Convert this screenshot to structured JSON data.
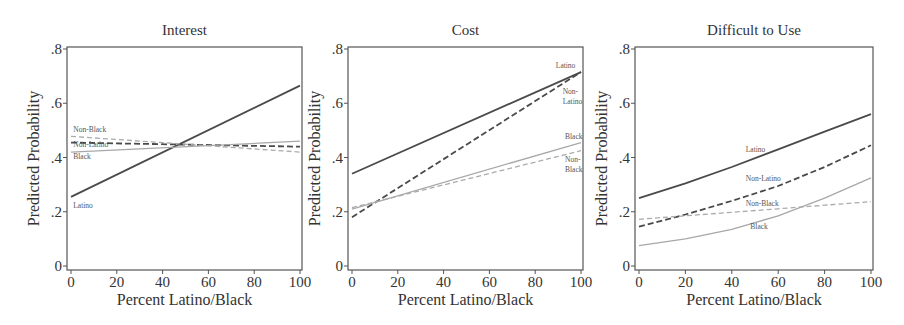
{
  "figure": {
    "shared": {
      "ylabel": "Predicted Probability",
      "xlabel": "Percent Latino/Black",
      "xticks": [
        "0",
        "20",
        "40",
        "60",
        "80",
        "100"
      ],
      "yticks": [
        "0",
        ".2",
        ".4",
        ".6",
        ".8"
      ]
    }
  },
  "chart_data": [
    {
      "type": "line",
      "title": "Interest",
      "xlabel": "Percent Latino/Black",
      "ylabel": "Predicted Probability",
      "xlim": [
        0,
        100
      ],
      "ylim": [
        0,
        0.8
      ],
      "x": [
        0,
        100
      ],
      "series": [
        {
          "name": "Latino",
          "style": "solid-dark",
          "color": "#444444",
          "values": [
            0.255,
            0.665
          ],
          "label_pos": {
            "x": 1,
            "y": 0.215
          }
        },
        {
          "name": "Non-Latino",
          "style": "dashed-dark",
          "color": "#444444",
          "values": [
            0.455,
            0.44
          ],
          "label_pos": {
            "x": 1,
            "y": 0.437
          }
        },
        {
          "name": "Black",
          "style": "solid-light",
          "color": "#a8a8a8",
          "values": [
            0.42,
            0.46
          ],
          "label_pos": {
            "x": 1,
            "y": 0.395
          }
        },
        {
          "name": "Non-Black",
          "style": "dashed-light",
          "color": "#a8a8a8",
          "values": [
            0.478,
            0.42
          ],
          "label_pos": {
            "x": 1,
            "y": 0.495
          }
        }
      ]
    },
    {
      "type": "line",
      "title": "Cost",
      "xlabel": "Percent Latino/Black",
      "ylabel": "Predicted Probability",
      "xlim": [
        0,
        100
      ],
      "ylim": [
        0,
        0.8
      ],
      "x": [
        0,
        100
      ],
      "series": [
        {
          "name": "Latino",
          "style": "solid-dark",
          "color": "#444444",
          "values": [
            0.34,
            0.715
          ],
          "label_pos": {
            "x": 89,
            "y": 0.73
          }
        },
        {
          "name": "Non-Latino",
          "style": "dashed-dark",
          "color": "#444444",
          "values": [
            0.18,
            0.715
          ],
          "label_pos": {
            "x": 92,
            "y": 0.635
          }
        },
        {
          "name": "Black",
          "style": "solid-light",
          "color": "#a8a8a8",
          "values": [
            0.21,
            0.455
          ],
          "label_pos": {
            "x": 93,
            "y": 0.47
          }
        },
        {
          "name": "Non-Black",
          "style": "dashed-light",
          "color": "#a8a8a8",
          "values": [
            0.215,
            0.425
          ],
          "label_pos": {
            "x": 93,
            "y": 0.385
          }
        }
      ]
    },
    {
      "type": "line",
      "title": "Difficult to Use",
      "xlabel": "Percent Latino/Black",
      "ylabel": "Predicted Probability",
      "xlim": [
        0,
        100
      ],
      "ylim": [
        0,
        0.8
      ],
      "x": [
        0,
        20,
        40,
        60,
        80,
        100
      ],
      "series": [
        {
          "name": "Latino",
          "style": "solid-dark",
          "color": "#444444",
          "values": [
            0.25,
            0.305,
            0.365,
            0.43,
            0.495,
            0.56
          ],
          "label_pos": {
            "x": 46,
            "y": 0.42
          }
        },
        {
          "name": "Non-Latino",
          "style": "dashed-dark",
          "color": "#444444",
          "values": [
            0.145,
            0.19,
            0.24,
            0.295,
            0.365,
            0.445
          ],
          "label_pos": {
            "x": 46,
            "y": 0.315
          }
        },
        {
          "name": "Non-Black",
          "style": "dashed-light",
          "color": "#a8a8a8",
          "values": [
            0.172,
            0.185,
            0.198,
            0.211,
            0.224,
            0.237
          ],
          "label_pos": {
            "x": 46,
            "y": 0.22
          }
        },
        {
          "name": "Black",
          "style": "solid-light",
          "color": "#a8a8a8",
          "values": [
            0.075,
            0.1,
            0.135,
            0.185,
            0.25,
            0.325
          ],
          "label_pos": {
            "x": 48,
            "y": 0.135
          }
        }
      ]
    }
  ]
}
